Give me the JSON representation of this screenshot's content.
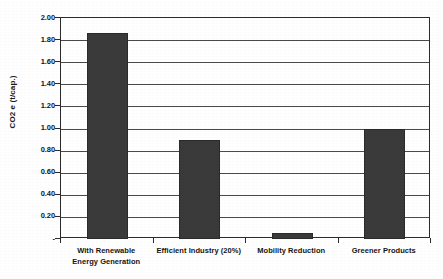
{
  "chart_data": {
    "type": "bar",
    "title": "",
    "xlabel": "",
    "ylabel": "CO2 e (t/cap.)",
    "categories": [
      "With Renewable Energy Generation",
      "Efficient Industry (20%)",
      "Mobility Reduction",
      "Greener Products"
    ],
    "category_lines": [
      [
        "With Renewable",
        "Energy Generation"
      ],
      [
        "Efficient Industry (20%)",
        ""
      ],
      [
        "Mobility Reduction",
        ""
      ],
      [
        "Greener Products",
        ""
      ]
    ],
    "values": [
      1.86,
      0.9,
      0.05,
      1.0
    ],
    "ylim": [
      0,
      2.0
    ],
    "ytick_step": 0.2,
    "ytick_labels": [
      "2.00",
      "1.80",
      "1.60",
      "1.40",
      "1.20",
      "1.00",
      "0.80",
      "0.60",
      "0.40",
      "0.20",
      "-"
    ],
    "ytick_values": [
      2.0,
      1.8,
      1.6,
      1.4,
      1.2,
      1.0,
      0.8,
      0.6,
      0.4,
      0.2,
      0.0
    ],
    "grid": "horizontal",
    "legend": "none",
    "bar_color": "#3a3a3a",
    "axis_color": "#2b2b2b",
    "gridline_color": "#4a4a4a",
    "background_color": "#ffffff"
  }
}
